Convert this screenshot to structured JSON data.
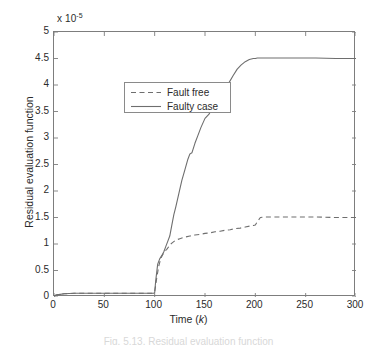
{
  "figure": {
    "background_color": "#ffffff",
    "axis_color": "#7d7d7d",
    "line_color": "#6e6e6e",
    "caption_fragment": "Fig. 5.13.  Residual evaluation function"
  },
  "chart_data": {
    "type": "line",
    "title": "",
    "xlabel": "Time (k)",
    "ylabel": "Residual evaluation function",
    "y_exponent_label": "x 10",
    "y_exponent_power": "-5",
    "xlim": [
      0,
      300
    ],
    "ylim": [
      0,
      5
    ],
    "xticks": [
      0,
      50,
      100,
      150,
      200,
      250,
      300
    ],
    "xtick_labels": [
      "0",
      "50",
      "100",
      "150",
      "200",
      "250",
      "300"
    ],
    "yticks": [
      0,
      0.5,
      1,
      1.5,
      2,
      2.5,
      3,
      3.5,
      4,
      4.5,
      5
    ],
    "ytick_labels": [
      "0",
      "0.5",
      "1",
      "1.5",
      "2",
      "2.5",
      "3",
      "3.5",
      "4",
      "4.5",
      "5"
    ],
    "grid": false,
    "legend_position": "upper left",
    "series": [
      {
        "name": "Fault free",
        "style": "dashed",
        "color": "#6e6e6e",
        "x": [
          0,
          3,
          6,
          10,
          15,
          20,
          30,
          40,
          50,
          60,
          70,
          80,
          90,
          95,
          98,
          100,
          102,
          104,
          106,
          108,
          110,
          112,
          114,
          116,
          118,
          120,
          122,
          125,
          130,
          135,
          140,
          145,
          150,
          155,
          160,
          165,
          170,
          175,
          180,
          185,
          190,
          195,
          198,
          200,
          202,
          205,
          210,
          220,
          240,
          260,
          280,
          300
        ],
        "y": [
          0.02,
          0.04,
          0.05,
          0.06,
          0.065,
          0.07,
          0.07,
          0.07,
          0.07,
          0.07,
          0.07,
          0.07,
          0.07,
          0.07,
          0.07,
          0.1,
          0.35,
          0.58,
          0.72,
          0.8,
          0.86,
          0.9,
          0.95,
          1.0,
          1.03,
          1.06,
          1.08,
          1.1,
          1.13,
          1.15,
          1.17,
          1.18,
          1.2,
          1.21,
          1.23,
          1.24,
          1.26,
          1.27,
          1.29,
          1.3,
          1.32,
          1.34,
          1.35,
          1.36,
          1.42,
          1.5,
          1.51,
          1.51,
          1.51,
          1.51,
          1.5,
          1.5
        ]
      },
      {
        "name": "Faulty case",
        "style": "solid",
        "color": "#6e6e6e",
        "x": [
          0,
          3,
          6,
          10,
          15,
          20,
          30,
          40,
          50,
          60,
          70,
          80,
          90,
          95,
          99,
          100,
          101,
          103,
          105,
          107,
          109,
          111,
          113,
          115,
          117,
          119,
          121,
          124,
          127,
          130,
          133,
          135,
          137,
          140,
          143,
          146,
          150,
          154,
          158,
          162,
          166,
          170,
          174,
          178,
          182,
          186,
          190,
          194,
          198,
          200,
          202,
          205,
          210,
          220,
          240,
          260,
          280,
          300
        ],
        "y": [
          0.02,
          0.04,
          0.05,
          0.06,
          0.065,
          0.07,
          0.07,
          0.07,
          0.07,
          0.07,
          0.07,
          0.07,
          0.07,
          0.07,
          0.07,
          0.08,
          0.3,
          0.62,
          0.72,
          0.78,
          0.85,
          0.95,
          1.05,
          1.15,
          1.35,
          1.55,
          1.7,
          1.95,
          2.2,
          2.4,
          2.6,
          2.7,
          2.72,
          2.9,
          3.05,
          3.2,
          3.37,
          3.45,
          3.6,
          3.72,
          3.85,
          3.95,
          4.05,
          4.18,
          4.3,
          4.38,
          4.44,
          4.48,
          4.5,
          4.5,
          4.51,
          4.51,
          4.51,
          4.51,
          4.51,
          4.51,
          4.5,
          4.5
        ]
      }
    ],
    "legend_entries": [
      {
        "label": "Fault free",
        "style": "dashed"
      },
      {
        "label": "Faulty case",
        "style": "solid"
      }
    ]
  }
}
